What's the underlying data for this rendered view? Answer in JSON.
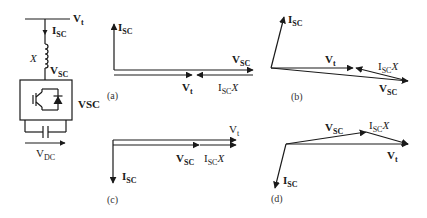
{
  "circuit": {
    "bus_label": "V",
    "bus_label_sub": "t",
    "current_label": "I",
    "current_label_sub": "SC",
    "reactance_label": "X",
    "converter_voltage_label": "V",
    "converter_voltage_label_sub": "SC",
    "converter_label": "VSC",
    "dc_voltage_label": "V",
    "dc_voltage_label_sub": "DC"
  },
  "phasor_diagrams": [
    {
      "id": "a",
      "panel_label": "(a)",
      "labels": {
        "isc": "I",
        "isc_sub": "SC",
        "vt": "V",
        "vt_sub": "t",
        "vsc": "V",
        "vsc_sub": "SC",
        "iscx": "I",
        "iscx_sub": "SC",
        "iscx_suffix": "X"
      }
    },
    {
      "id": "b",
      "panel_label": "(b)",
      "labels": {
        "isc": "I",
        "isc_sub": "SC",
        "vt": "V",
        "vt_sub": "t",
        "vsc": "V",
        "vsc_sub": "SC",
        "iscx": "I",
        "iscx_sub": "SC",
        "iscx_suffix": "X"
      }
    },
    {
      "id": "c",
      "panel_label": "(c)",
      "labels": {
        "isc": "I",
        "isc_sub": "SC",
        "vt": "V",
        "vt_sub": "t",
        "vsc": "V",
        "vsc_sub": "SC",
        "iscx": "I",
        "iscx_sub": "SC",
        "iscx_suffix": "X"
      }
    },
    {
      "id": "d",
      "panel_label": "(d)",
      "labels": {
        "isc": "I",
        "isc_sub": "SC",
        "vt": "V",
        "vt_sub": "t",
        "vsc": "V",
        "vsc_sub": "SC",
        "iscx": "I",
        "iscx_sub": "SC",
        "iscx_suffix": "X"
      }
    }
  ]
}
